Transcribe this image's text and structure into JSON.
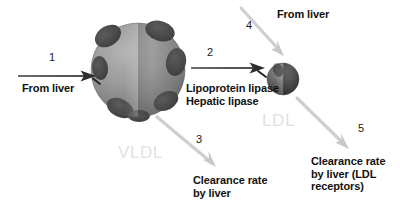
{
  "diagram": {
    "background_color": "#ffffff",
    "particles": [
      {
        "id": "vldl",
        "label": "VLDL",
        "label_color": "#e2e2e2",
        "kind": "large-lipoprotein-sphere",
        "base_color": "#8a8a8a",
        "spot_color": "#4a4a4a",
        "cx": 138,
        "cy": 70,
        "r": 47
      },
      {
        "id": "ldl",
        "label": "LDL",
        "label_color": "#e2e2e2",
        "kind": "small-lipoprotein-sphere",
        "base_color": "#4f4f4f",
        "spot_color": "#2b2b2b",
        "cx": 283,
        "cy": 79,
        "r": 16
      }
    ],
    "arrows": [
      {
        "number": "1",
        "label": "From liver",
        "color": "#2b2b2b",
        "style": "dark-horizontal",
        "x1": 18,
        "y1": 76,
        "x2": 96,
        "y2": 76
      },
      {
        "number": "2",
        "label": "Lipoprotein lipase\nHepatic lipase",
        "color": "#2b2b2b",
        "style": "dark-horizontal",
        "x1": 191,
        "y1": 68,
        "x2": 265,
        "y2": 68
      },
      {
        "number": "3",
        "label": "Clearance rate\nby liver",
        "color": "#cccccc",
        "style": "light-diagonal",
        "x1": 157,
        "y1": 117,
        "x2": 215,
        "y2": 166
      },
      {
        "number": "4",
        "label": "From liver",
        "color": "#cccccc",
        "style": "light-diagonal",
        "x1": 240,
        "y1": 6,
        "x2": 283,
        "y2": 55
      },
      {
        "number": "5",
        "label": "Clearance rate\nby liver (LDL\nreceptors)",
        "color": "#cccccc",
        "style": "light-diagonal",
        "x1": 297,
        "y1": 98,
        "x2": 348,
        "y2": 148
      }
    ],
    "labels": {
      "from_liver_1": "From liver",
      "from_liver_4": "From liver",
      "lipases": "Lipoprotein lipase\nHepatic lipase",
      "clearance_liver": "Clearance rate\nby liver",
      "clearance_ldl_receptors": "Clearance rate\nby liver (LDL\nreceptors)",
      "vldl": "VLDL",
      "ldl": "LDL"
    },
    "numbers": {
      "one": "1",
      "two": "2",
      "three": "3",
      "four": "4",
      "five": "5"
    }
  }
}
